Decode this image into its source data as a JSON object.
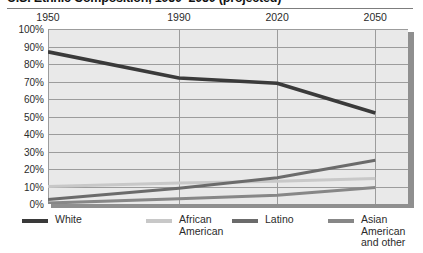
{
  "chart_data": {
    "type": "line",
    "title": "U.S. Ethnic Composition, 1950–2050 (projected)",
    "xlabel": "",
    "ylabel": "",
    "x": [
      1950,
      1990,
      2020,
      2050
    ],
    "xlim": [
      1950,
      2060
    ],
    "ylim": [
      0,
      100
    ],
    "xtick_labels": [
      "1950",
      "1990",
      "2020",
      "2050"
    ],
    "ytick_labels": [
      "100%",
      "90%",
      "80%",
      "70%",
      "60%",
      "50%",
      "40%",
      "30%",
      "20%",
      "10%",
      "0%"
    ],
    "ytick_values": [
      100,
      90,
      80,
      70,
      60,
      50,
      40,
      30,
      20,
      10,
      0
    ],
    "grid": true,
    "legend_position": "bottom",
    "series": [
      {
        "name": "White",
        "color": "#3a3a3a",
        "values": [
          87,
          72,
          69,
          52
        ]
      },
      {
        "name": "African\nAmerican",
        "color": "#c8c8c8",
        "values": [
          10,
          12,
          13,
          14.5
        ]
      },
      {
        "name": "Latino",
        "color": "#6b6b6b",
        "values": [
          2.5,
          9,
          15,
          25
        ]
      },
      {
        "name": "Asian\nAmerican\nand other",
        "color": "#878787",
        "values": [
          0.5,
          3,
          5,
          9.5
        ]
      }
    ]
  },
  "legend": {
    "entries": [
      {
        "label": "White",
        "swatch": "legend-swatch-white"
      },
      {
        "label": "African\nAmerican",
        "swatch": "legend-swatch-african-american"
      },
      {
        "label": "Latino",
        "swatch": "legend-swatch-latino"
      },
      {
        "label": "Asian\nAmerican\nand other",
        "swatch": "legend-swatch-asian-american"
      }
    ]
  },
  "colors": {
    "plot_background": "#e9e9e9",
    "gridline": "#9c9c9c",
    "shadow": "#8f8f8f",
    "title_rule": "#7d7d7d",
    "white_series": "#3a3a3a",
    "african_american_series": "#c8c8c8",
    "latino_series": "#6b6b6b",
    "asian_american_series": "#878787"
  }
}
